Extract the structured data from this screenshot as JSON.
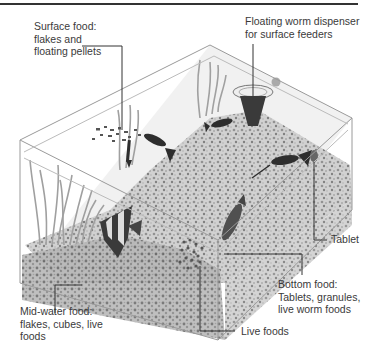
{
  "figure": {
    "labels": {
      "surface_food": {
        "lines": [
          "Surface food:",
          "flakes and",
          "floating pellets"
        ]
      },
      "worm_dispenser": {
        "lines": [
          "Floating worm dispenser",
          "for surface feeders"
        ]
      },
      "tablet": {
        "lines": [
          "Tablet"
        ]
      },
      "bottom_food": {
        "lines": [
          "Bottom food:",
          "Tablets, granules,",
          "live worm foods"
        ]
      },
      "mid_water_food": {
        "lines": [
          "Mid-water food:",
          "flakes, cubes, live",
          "foods"
        ]
      },
      "live_foods": {
        "lines": [
          "Live foods"
        ]
      }
    },
    "colors": {
      "text": "#3a3a3a",
      "leader_line": "#333333",
      "glass_edge": "#9a9a9a",
      "gravel": "#bdbdbd",
      "plants": "#a8a8a8",
      "fish": "#2e2e2e"
    }
  }
}
